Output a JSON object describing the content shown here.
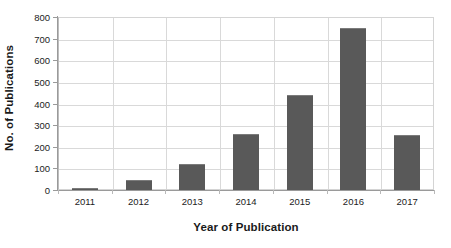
{
  "chart_data": {
    "type": "bar",
    "title": "",
    "subtitle": "",
    "xlabel": "Year of Publication",
    "ylabel": "No. of Publications",
    "categories": [
      "2011",
      "2012",
      "2013",
      "2014",
      "2015",
      "2016",
      "2017"
    ],
    "values": [
      10,
      48,
      120,
      260,
      440,
      750,
      255
    ],
    "series": [
      {
        "name": "No. of Publications",
        "values": [
          10,
          48,
          120,
          260,
          440,
          750,
          255
        ]
      }
    ],
    "ylim": [
      0,
      800
    ],
    "ytick_step": 100,
    "ytick_labels": [
      "0",
      "100",
      "200",
      "300",
      "400",
      "500",
      "600",
      "700",
      "800"
    ],
    "ytick_values": [
      0,
      100,
      200,
      300,
      400,
      500,
      600,
      700,
      800
    ],
    "xtick_labels": [
      "2011",
      "2012",
      "2013",
      "2014",
      "2015",
      "2016",
      "2017"
    ],
    "grid": {
      "horizontal": true,
      "vertical": true,
      "color": "#d9d9d9"
    },
    "legend": {
      "visible": false,
      "position": "none",
      "entries": []
    },
    "colors": {
      "bar_fill": "#595959",
      "bar_edge": "#7b7b7b",
      "axis_line": "#9a9a9a",
      "plot_border": "#d4d4d4",
      "grid": "#d9d9d9",
      "text": "#1c1c1c",
      "axis_title_text": "#1a1a1a",
      "background": "#ffffff"
    },
    "annotations": []
  }
}
